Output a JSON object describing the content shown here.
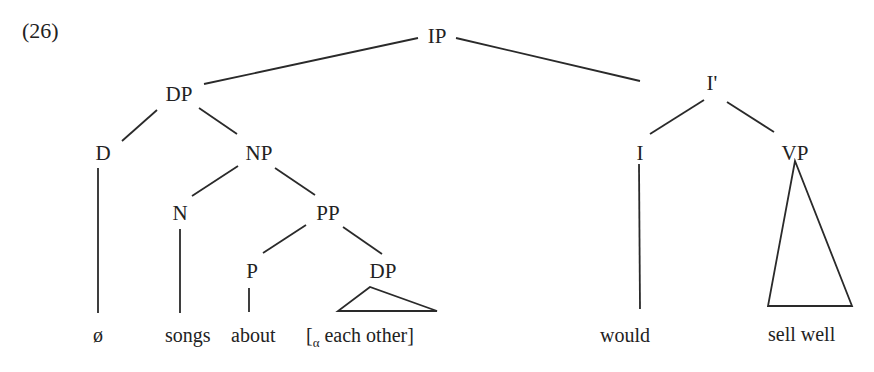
{
  "example_number": "(26)",
  "tree": {
    "IP": "IP",
    "DP_subject": "DP",
    "I_bar": "I'",
    "D": "D",
    "NP": "NP",
    "N": "N",
    "PP": "PP",
    "P": "P",
    "DP_object": "DP",
    "I": "I",
    "VP": "VP"
  },
  "terminals": {
    "D": "ø",
    "songs": "songs",
    "about": "about",
    "bracket_open": "[",
    "alpha": "α",
    "each_other": "each other]",
    "would": "would",
    "sell_well": "sell well"
  }
}
